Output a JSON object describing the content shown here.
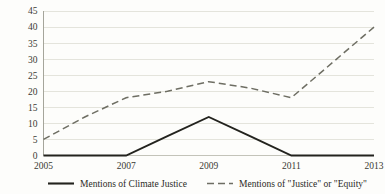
{
  "chart_data": {
    "type": "line",
    "title": "",
    "subtitle": "",
    "xlabel": "",
    "ylabel": "",
    "x": [
      2005,
      2006,
      2007,
      2008,
      2009,
      2010,
      2011,
      2012,
      2013
    ],
    "categories": [
      "2005",
      "2006",
      "2007",
      "2008",
      "2009",
      "2010",
      "2011",
      "2012",
      "2013"
    ],
    "xtick_labels": [
      "2005",
      "2007",
      "2009",
      "2011",
      "2013"
    ],
    "xticks": [
      2005,
      2007,
      2009,
      2011,
      2013
    ],
    "ytick_labels": [
      "0",
      "5",
      "10",
      "15",
      "20",
      "25",
      "30",
      "35",
      "40",
      "45"
    ],
    "yticks": [
      0,
      5,
      10,
      15,
      20,
      25,
      30,
      35,
      40,
      45
    ],
    "ylim": [
      0,
      45
    ],
    "xlim": [
      2005,
      2013
    ],
    "grid": true,
    "grid_axis": "y",
    "legend_position": "bottom",
    "series": [
      {
        "name": "Mentions of Climate Justice",
        "style": "solid",
        "color": "#23231e",
        "values": [
          0,
          0,
          0,
          6,
          12,
          6,
          0,
          0,
          0
        ]
      },
      {
        "name": "Mentions of \"Justice\" or \"Equity\"",
        "style": "dashed",
        "color": "#6e6e63",
        "values": [
          5,
          12,
          18,
          20,
          23,
          21,
          18,
          29,
          40
        ]
      }
    ]
  },
  "legend": {
    "entries": [
      {
        "label": "Mentions of Climate Justice",
        "style": "solid"
      },
      {
        "label": "Mentions of \"Justice\" or \"Equity\"",
        "style": "dashed"
      }
    ]
  },
  "axes": {
    "y": {
      "labels": [
        "45",
        "40",
        "35",
        "30",
        "25",
        "20",
        "15",
        "10",
        "5",
        "0"
      ]
    },
    "x": {
      "labels": [
        "2005",
        "2007",
        "2009",
        "2011",
        "2013"
      ]
    }
  }
}
